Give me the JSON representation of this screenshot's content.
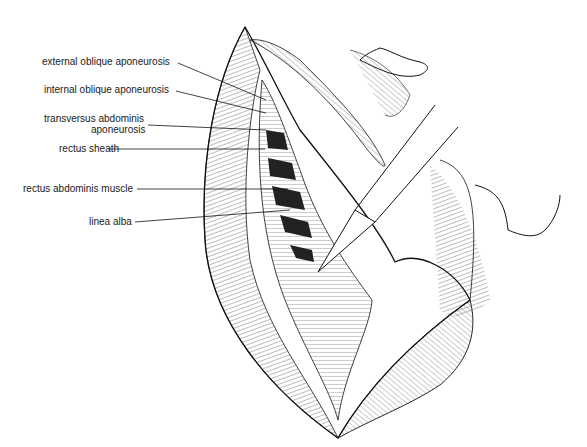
{
  "figure": {
    "labels": [
      {
        "id": "external-oblique",
        "text": "external oblique aponeurosis"
      },
      {
        "id": "internal-oblique",
        "text": "internal oblique aponeurosis"
      },
      {
        "id": "transversus-1",
        "text": "transversus abdominis"
      },
      {
        "id": "transversus-2",
        "text": "aponeurosis"
      },
      {
        "id": "rectus-sheath",
        "text": "rectus sheath"
      },
      {
        "id": "rectus-muscle",
        "text": "rectus abdominis muscle"
      },
      {
        "id": "linea-alba",
        "text": "linea alba"
      }
    ],
    "colors": {
      "ink": "#1a1a1a",
      "muscle": "#2a2a2a",
      "background": "#ffffff"
    }
  }
}
